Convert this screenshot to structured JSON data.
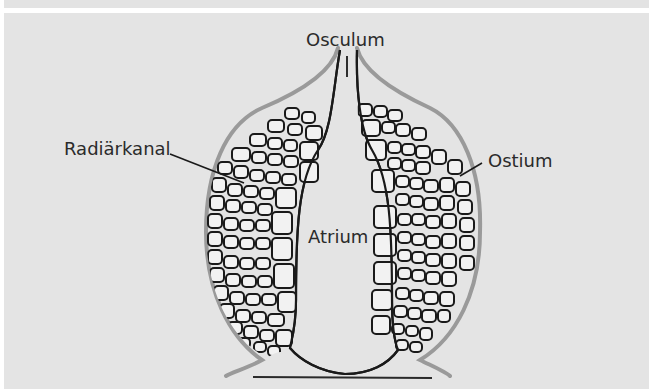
{
  "figure": {
    "background_color": "#e4e4e4",
    "outline_color": "#1a1a1a",
    "epidermis_color": "#9a9a9a"
  },
  "labels": {
    "osculum": "Osculum",
    "radial_canal": "Radiärkanal",
    "ostium": "Ostium",
    "atrium": "Atrium"
  }
}
